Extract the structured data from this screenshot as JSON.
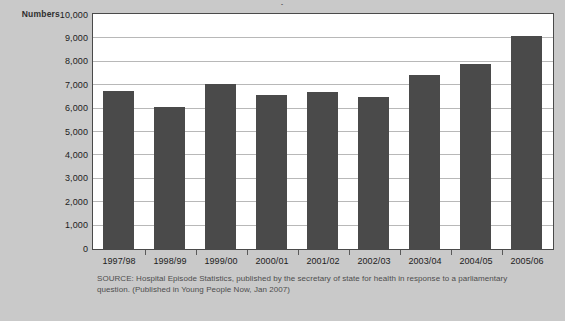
{
  "page": {
    "background_color": "#c9c9c9",
    "title_sliver": "·"
  },
  "chart_data": {
    "type": "bar",
    "title": "",
    "xlabel": "",
    "ylabel": "Numbers",
    "categories": [
      "1997/98",
      "1998/99",
      "1999/00",
      "2000/01",
      "2001/02",
      "2002/03",
      "2003/04",
      "2004/05",
      "2005/06"
    ],
    "values": [
      6750,
      6050,
      7050,
      6600,
      6700,
      6500,
      7450,
      7900,
      9100
    ],
    "ylim": [
      0,
      10000
    ],
    "ytick_labels": [
      "10,000",
      "9,000",
      "8,000",
      "7,000",
      "6,000",
      "5,000",
      "4,000",
      "3,000",
      "2,000",
      "1,000",
      "0"
    ],
    "ytick_values": [
      10000,
      9000,
      8000,
      7000,
      6000,
      5000,
      4000,
      3000,
      2000,
      1000,
      0
    ],
    "grid": true,
    "legend": false,
    "bar_color": "#4a4a4a",
    "plot_background": "#ffffff",
    "gridline_color": "#b8b8b8",
    "axis_color": "#4a4a4a"
  },
  "source": {
    "line1": "SOURCE: Hospital Episode Statistics, published by the secretary of state for health in response to a parliamentary",
    "line2": "question. (Published in Young People Now, Jan 2007)"
  }
}
